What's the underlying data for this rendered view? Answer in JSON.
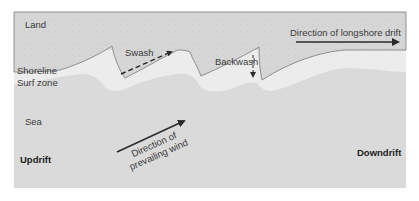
{
  "diagram": {
    "title": "Longshore drift",
    "labels": {
      "land": "Land",
      "shoreline": "Shoreline",
      "surf_zone": "Surf zone",
      "sea": "Sea",
      "swash": "Swash",
      "backwash": "Backwash",
      "longshore_drift": "Direction of longshore drift",
      "wind_line1": "Direction of",
      "wind_line2": "prevailing wind",
      "updrift": "Updrift",
      "downdrift": "Downdrift"
    },
    "colors": {
      "land": "#d4d4d4",
      "surf_zone": "#ececec",
      "sea": "#dadada",
      "shoreline_stroke": "#7a7a7a",
      "arrow": "#2a2a2a",
      "text": "#3a3a3a"
    }
  }
}
